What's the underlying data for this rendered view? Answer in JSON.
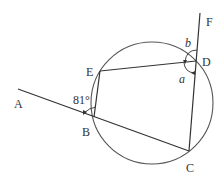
{
  "diagram": {
    "points": {
      "A": {
        "label": "A",
        "x": 18,
        "y": 89
      },
      "B": {
        "label": "B",
        "x": 94,
        "y": 117
      },
      "C": {
        "label": "C",
        "x": 189,
        "y": 151
      },
      "D": {
        "label": "D",
        "x": 196,
        "y": 61
      },
      "E": {
        "label": "E",
        "x": 100,
        "y": 71
      },
      "F": {
        "label": "F",
        "x": 200,
        "y": 14
      }
    },
    "circle": {
      "cx": 152,
      "cy": 103,
      "r": 60
    },
    "angles": {
      "ABE": {
        "label": "81°"
      },
      "a": {
        "label": "a"
      },
      "b": {
        "label": "b"
      }
    },
    "colors": {
      "stroke": "#333333",
      "background": "#ffffff"
    }
  }
}
